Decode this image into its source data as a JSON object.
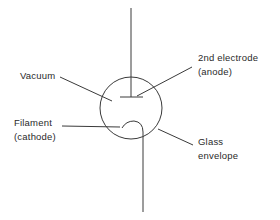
{
  "diagram": {
    "type": "vacuum-tube-diode",
    "colors": {
      "line": "#3a3a3a",
      "text": "#2a2a2a",
      "background": "#ffffff"
    },
    "labels": {
      "vacuum": "Vacuum",
      "anode_line1": "2nd electrode",
      "anode_line2": "(anode)",
      "filament_line1": "Filament",
      "filament_line2": "(cathode)",
      "glass_line1": "Glass",
      "glass_line2": "envelope"
    }
  }
}
